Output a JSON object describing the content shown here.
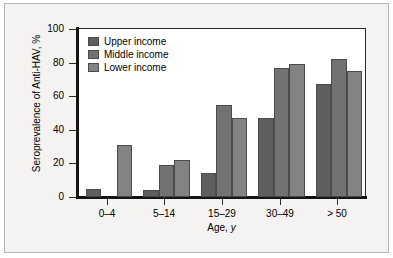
{
  "chart_data": {
    "type": "bar",
    "title": "",
    "subtitle": "",
    "xlabel": "Age, y",
    "ylabel": "Seroprevalence of Anti-HAV, %",
    "categories": [
      "0–4",
      "5–14",
      "15–29",
      "30–49",
      "> 50"
    ],
    "series": [
      {
        "name": "Upper income",
        "color": "#5e5e5e",
        "values": [
          5,
          4,
          14,
          47,
          67
        ]
      },
      {
        "name": "Middle income",
        "color": "#727272",
        "values": [
          0,
          19,
          55,
          77,
          82
        ]
      },
      {
        "name": "Lower income",
        "color": "#838383",
        "values": [
          31,
          22,
          47,
          79,
          75
        ]
      }
    ],
    "ylim": [
      0,
      100
    ],
    "yticks": [
      0,
      20,
      40,
      60,
      80,
      100
    ],
    "ytick_labels": [
      "0",
      "20",
      "40",
      "60",
      "80",
      "100"
    ],
    "grid": false,
    "legend_position": "top-left",
    "bar_edge_color": "#4b4b4b",
    "axis_color": "#141414",
    "plot_background": "#ffffff",
    "figure_background": "#f4f3f1"
  },
  "axis": {
    "y_title": "Seroprevalence of Anti-HAV, %",
    "x_title_prefix": "Age, ",
    "x_title_italic": "y"
  }
}
